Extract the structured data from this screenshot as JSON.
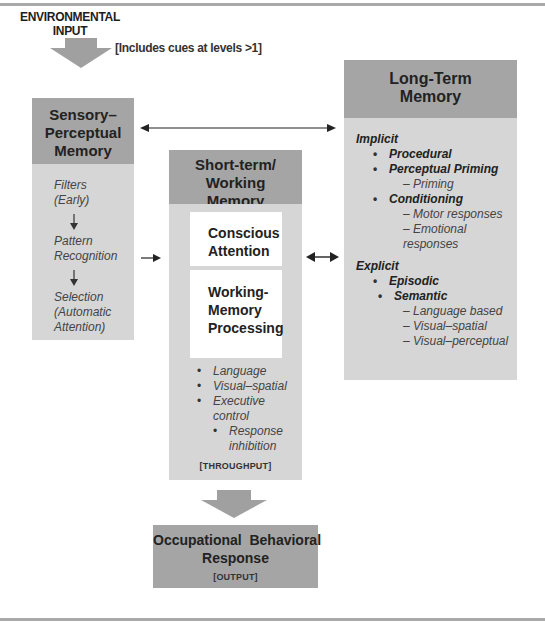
{
  "diagram": {
    "input": {
      "label_line1": "ENVIRONMENTAL",
      "label_line2": "INPUT",
      "note": "[Includes cues at levels >1]"
    },
    "sensory": {
      "title_line1": "Sensory–",
      "title_line2": "Perceptual",
      "title_line3": "Memory",
      "steps": [
        {
          "line1": "Filters",
          "line2": "(Early)"
        },
        {
          "line1": "Pattern",
          "line2": "Recognition"
        },
        {
          "line1": "Selection",
          "line2": "(Automatic",
          "line3": "Attention)"
        }
      ]
    },
    "short_term": {
      "title_line1": "Short-term/",
      "title_line2": "Working",
      "title_line3": "Memory",
      "conscious_line1": "Conscious",
      "conscious_line2": "Attention",
      "processing_line1": "Working-",
      "processing_line2": "Memory",
      "processing_line3": "Processing",
      "bullets": [
        "Language",
        "Visual–spatial",
        "Executive",
        "control"
      ],
      "sub_bullet_line1": "Response",
      "sub_bullet_line2": "inhibition",
      "tag": "[THROUGHPUT]"
    },
    "long_term": {
      "title_line1": "Long-Term",
      "title_line2": "Memory",
      "implicit": {
        "heading": "Implicit",
        "items": [
          "Procedural",
          "Perceptual Priming",
          "Conditioning"
        ],
        "priming_sub": "– Priming",
        "conditioning_subs": [
          "– Motor responses",
          "– Emotional responses"
        ]
      },
      "explicit": {
        "heading": "Explicit",
        "items": [
          "Episodic",
          "Semantic"
        ],
        "semantic_subs": [
          "– Language based",
          "– Visual–spatial",
          "– Visual–perceptual"
        ]
      }
    },
    "output": {
      "title_line1": "Occupational  Behavioral",
      "title_line2": "Response",
      "tag": "[OUTPUT]"
    },
    "colors": {
      "header_gray": "#a5a5a5",
      "body_gray": "#d6d6d6",
      "arrow_gray": "#a0a0a0",
      "rule_gray": "#a9a9a9"
    }
  }
}
